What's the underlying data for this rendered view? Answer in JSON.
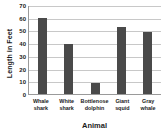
{
  "chart_data": {
    "type": "bar",
    "title": "",
    "xlabel": "Animal",
    "ylabel": "Length in Feet",
    "categories": [
      "Whale shark",
      "White shark",
      "Bottlenose dolphin",
      "Giant squid",
      "Gray whale"
    ],
    "category_lines": [
      [
        "Whale",
        "shark"
      ],
      [
        "White",
        "shark"
      ],
      [
        "Bottlenose",
        "dolphin"
      ],
      [
        "Giant",
        "squid"
      ],
      [
        "Gray",
        "whale"
      ]
    ],
    "values": [
      60,
      39,
      9,
      53,
      49
    ],
    "ylim": [
      0,
      70
    ],
    "ytick_labels": [
      "70",
      "60",
      "50",
      "40",
      "30",
      "20",
      "10",
      "0"
    ],
    "ytick_values": [
      70,
      60,
      50,
      40,
      30,
      20,
      10,
      0
    ],
    "grid": true,
    "grid_axis": "y",
    "legend": false,
    "bar_color": "#4a4a4a",
    "grid_color": "#c8c8c8",
    "axis_color": "#9a9a9a",
    "text_color": "#1a1a1a",
    "background_color": "#ffffff"
  }
}
